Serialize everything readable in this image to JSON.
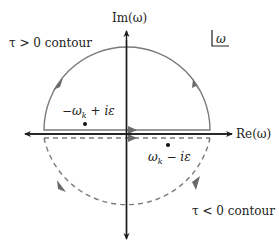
{
  "diagram": {
    "axes": {
      "x_label": "Re(ω)",
      "y_label": "Im(ω)"
    },
    "plane_marker": "ω",
    "contours": {
      "upper": {
        "label": "τ > 0 contour",
        "style": "solid",
        "direction": "counterclockwise"
      },
      "lower": {
        "label": "τ < 0 contour",
        "style": "dashed",
        "direction": "clockwise"
      }
    },
    "poles": {
      "upper": {
        "label_main": "−ω",
        "label_sub": "k",
        "label_rest": " + iε"
      },
      "lower": {
        "label_main": "ω",
        "label_sub": "k",
        "label_rest": " − iε"
      }
    },
    "colors": {
      "axes": "#1a1a1a",
      "contour": "#7a7a7a",
      "text": "#222222"
    }
  }
}
